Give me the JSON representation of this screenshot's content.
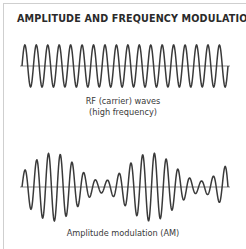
{
  "title": "AMPLITUDE AND FREQUENCY MODULATION",
  "carrier": {
    "caption_line1": "RF (carrier) waves",
    "caption_line2": "(high frequency)",
    "cycles": 18,
    "x_start": 22,
    "x_end": 228,
    "axis_y": 66,
    "amplitude": 21
  },
  "am": {
    "caption": "Amplitude modulation (AM)",
    "cycles": 17.5,
    "x_start": 22,
    "x_end": 228,
    "axis_y": 187,
    "max_amplitude": 34,
    "min_amplitude": 6
  },
  "colors": {
    "wave": "#3a3a3a",
    "axis": "#555555",
    "border": "#cfcfcf",
    "text": "#2a2a2a"
  }
}
